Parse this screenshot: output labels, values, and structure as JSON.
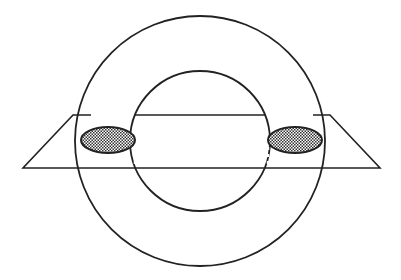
{
  "diagram": {
    "colors": {
      "stroke": "#222222",
      "background": "#ffffff",
      "hatch": "#333333"
    },
    "outer_circle": {
      "cx": 200,
      "cy": 141,
      "r": 125
    },
    "inner_circle": {
      "cx": 200,
      "cy": 141,
      "r": 70
    },
    "plane": {
      "top_y": 115,
      "bottom_y": 168,
      "top_left_x": 73,
      "top_right_x": 330,
      "bottom_left_x": 23,
      "bottom_right_x": 380
    },
    "cross_sections": [
      {
        "cx": 108,
        "cy": 140,
        "rx": 27,
        "ry": 13
      },
      {
        "cx": 295,
        "cy": 140,
        "rx": 27,
        "ry": 13
      }
    ]
  }
}
